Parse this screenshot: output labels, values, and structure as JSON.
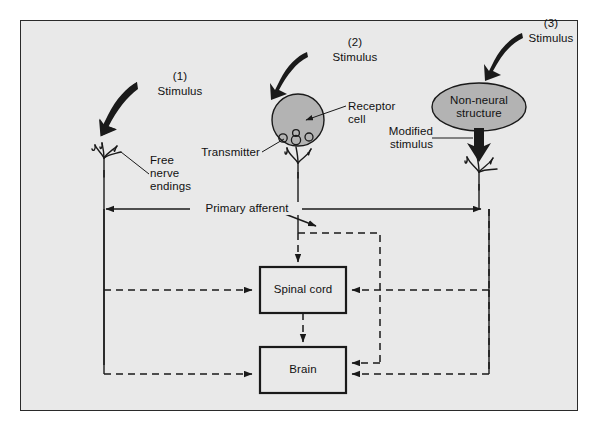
{
  "figure": {
    "background_color": "#e9e9e9",
    "frame_border_color": "#2a2a2a",
    "shape_fill_color": "#b3b3b3",
    "arrow_color": "#1a1a1a"
  },
  "pathways": [
    {
      "number": "(1)",
      "stimulus_label": "Stimulus",
      "receptor_label": "Free\nnerve\nendings",
      "receptor_type": "free-nerve-endings"
    },
    {
      "number": "(2)",
      "stimulus_label": "Stimulus",
      "receptor_label": "Receptor\ncell",
      "transmitter_label": "Transmitter",
      "receptor_type": "receptor-cell"
    },
    {
      "number": "(3)",
      "stimulus_label": "Stimulus",
      "structure_label": "Non-neural\nstructure",
      "modified_label": "Modified\nstimulus",
      "receptor_type": "non-neural-structure"
    }
  ],
  "labels": {
    "num1": "(1)",
    "stim1": "Stimulus",
    "free_nerve_endings": "Free\nnerve\nendings",
    "num2": "(2)",
    "stim2": "Stimulus",
    "receptor_cell": "Receptor\ncell",
    "transmitter": "Transmitter",
    "num3": "(3)",
    "stim3": "Stimulus",
    "non_neural_structure": "Non-neural\nstructure",
    "modified_stimulus": "Modified\nstimulus",
    "primary_afferent": "Primary afferent",
    "spinal_cord": "Spinal cord",
    "brain": "Brain"
  },
  "nodes": [
    {
      "name": "spinal-cord",
      "label": "Spinal cord"
    },
    {
      "name": "brain",
      "label": "Brain"
    }
  ],
  "connections": {
    "solid_note": "Primary afferent axons (solid lines)",
    "dashed_note": "Central projections and feedback (dashed lines)"
  }
}
